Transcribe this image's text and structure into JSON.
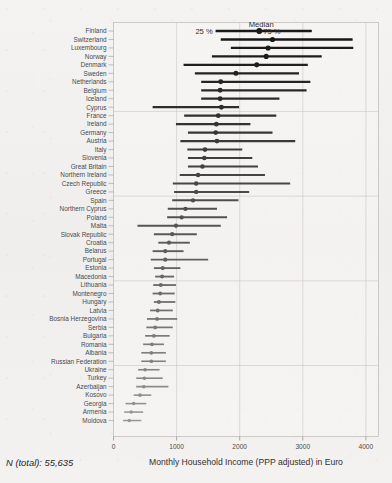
{
  "figure": {
    "n_total_label": "N (total): 55,635",
    "xlabel": "Monthly Household Income (PPP adjusted) in Euro",
    "legend": {
      "left": "25 %",
      "center": "Median",
      "right": "75 %"
    }
  },
  "chart_data": {
    "type": "scatter",
    "subtype": "dot-plot-with-interquartile-range",
    "title": "",
    "xlabel": "Monthly Household Income (PPP adjusted) in Euro",
    "ylabel": "",
    "xlim": [
      0,
      4200
    ],
    "xticks": [
      0,
      1000,
      2000,
      3000,
      4000
    ],
    "xticklabels": [
      "0",
      "1000",
      "2000",
      "3000",
      "4000"
    ],
    "grid": "vertical-and-horizontal-light",
    "legend_position": "top",
    "legend_entries": [
      "25 %",
      "Median",
      "75 %"
    ],
    "annotations": [
      "N (total): 55,635"
    ],
    "series_fields": [
      "country",
      "p25",
      "median",
      "p75"
    ],
    "categories": [
      "Finland",
      "Switzerland",
      "Luxembourg",
      "Norway",
      "Denmark",
      "Sweden",
      "Netherlands",
      "Belgium",
      "Iceland",
      "Cyprus",
      "France",
      "Ireland",
      "Germany",
      "Austria",
      "Italy",
      "Slovenia",
      "Great Britain",
      "Northern Ireland",
      "Czech Republic",
      "Greece",
      "Spain",
      "Northern Cyprus",
      "Poland",
      "Malta",
      "Slovak Republic",
      "Croatia",
      "Belarus",
      "Portugal",
      "Estonia",
      "Macedonia",
      "Lithuania",
      "Montenegro",
      "Hungary",
      "Latvia",
      "Bosnia Herzegovina",
      "Serbia",
      "Bulgaria",
      "Romania",
      "Albania",
      "Russian Federation",
      "Ukraine",
      "Turkey",
      "Azerbaijan",
      "Kosovo",
      "Georgia",
      "Armenia",
      "Moldova"
    ],
    "rows": [
      {
        "country": "Finland",
        "p25": 1620,
        "median": 2310,
        "p75": 3140
      },
      {
        "country": "Switzerland",
        "p25": 1700,
        "median": 2520,
        "p75": 3790
      },
      {
        "country": "Luxembourg",
        "p25": 1860,
        "median": 2450,
        "p75": 3800
      },
      {
        "country": "Norway",
        "p25": 1560,
        "median": 2420,
        "p75": 3300
      },
      {
        "country": "Denmark",
        "p25": 1110,
        "median": 2270,
        "p75": 3080
      },
      {
        "country": "Sweden",
        "p25": 1290,
        "median": 1940,
        "p75": 2940
      },
      {
        "country": "Netherlands",
        "p25": 1390,
        "median": 1700,
        "p75": 3120
      },
      {
        "country": "Belgium",
        "p25": 1390,
        "median": 1690,
        "p75": 3060
      },
      {
        "country": "Iceland",
        "p25": 1390,
        "median": 1690,
        "p75": 2630
      },
      {
        "country": "Cyprus",
        "p25": 620,
        "median": 1710,
        "p75": 1990
      },
      {
        "country": "France",
        "p25": 1120,
        "median": 1660,
        "p75": 2580
      },
      {
        "country": "Ireland",
        "p25": 990,
        "median": 1630,
        "p75": 2170
      },
      {
        "country": "Germany",
        "p25": 1180,
        "median": 1620,
        "p75": 2520
      },
      {
        "country": "Austria",
        "p25": 1060,
        "median": 1640,
        "p75": 2880
      },
      {
        "country": "Italy",
        "p25": 1170,
        "median": 1450,
        "p75": 2040
      },
      {
        "country": "Slovenia",
        "p25": 1180,
        "median": 1440,
        "p75": 2200
      },
      {
        "country": "Great Britain",
        "p25": 1180,
        "median": 1410,
        "p75": 2290
      },
      {
        "country": "Northern Ireland",
        "p25": 1050,
        "median": 1340,
        "p75": 2400
      },
      {
        "country": "Czech Republic",
        "p25": 940,
        "median": 1310,
        "p75": 2800
      },
      {
        "country": "Greece",
        "p25": 960,
        "median": 1310,
        "p75": 2150
      },
      {
        "country": "Spain",
        "p25": 930,
        "median": 1260,
        "p75": 1980
      },
      {
        "country": "Northern Cyprus",
        "p25": 860,
        "median": 1140,
        "p75": 1640
      },
      {
        "country": "Poland",
        "p25": 850,
        "median": 1080,
        "p75": 1800
      },
      {
        "country": "Malta",
        "p25": 380,
        "median": 990,
        "p75": 1700
      },
      {
        "country": "Slovak Republic",
        "p25": 640,
        "median": 930,
        "p75": 1320
      },
      {
        "country": "Croatia",
        "p25": 710,
        "median": 880,
        "p75": 1210
      },
      {
        "country": "Belarus",
        "p25": 620,
        "median": 820,
        "p75": 1110
      },
      {
        "country": "Portugal",
        "p25": 590,
        "median": 820,
        "p75": 1500
      },
      {
        "country": "Estonia",
        "p25": 640,
        "median": 780,
        "p75": 1060
      },
      {
        "country": "Macedonia",
        "p25": 660,
        "median": 770,
        "p75": 960
      },
      {
        "country": "Lithuania",
        "p25": 630,
        "median": 750,
        "p75": 990
      },
      {
        "country": "Montenegro",
        "p25": 620,
        "median": 740,
        "p75": 970
      },
      {
        "country": "Hungary",
        "p25": 640,
        "median": 720,
        "p75": 980
      },
      {
        "country": "Latvia",
        "p25": 580,
        "median": 700,
        "p75": 940
      },
      {
        "country": "Bosnia Herzegovina",
        "p25": 530,
        "median": 690,
        "p75": 1010
      },
      {
        "country": "Serbia",
        "p25": 520,
        "median": 660,
        "p75": 940
      },
      {
        "country": "Bulgaria",
        "p25": 500,
        "median": 640,
        "p75": 890
      },
      {
        "country": "Romania",
        "p25": 470,
        "median": 610,
        "p75": 800
      },
      {
        "country": "Albania",
        "p25": 440,
        "median": 600,
        "p75": 830
      },
      {
        "country": "Russian Federation",
        "p25": 440,
        "median": 600,
        "p75": 830
      },
      {
        "country": "Ukraine",
        "p25": 390,
        "median": 500,
        "p75": 730
      },
      {
        "country": "Turkey",
        "p25": 360,
        "median": 490,
        "p75": 780
      },
      {
        "country": "Azerbaijan",
        "p25": 360,
        "median": 480,
        "p75": 870
      },
      {
        "country": "Kosovo",
        "p25": 320,
        "median": 420,
        "p75": 600
      },
      {
        "country": "Georgia",
        "p25": 190,
        "median": 320,
        "p75": 520
      },
      {
        "country": "Armenia",
        "p25": 170,
        "median": 280,
        "p75": 470
      },
      {
        "country": "Moldova",
        "p25": 150,
        "median": 250,
        "p75": 440
      }
    ]
  },
  "style": {
    "dot_color_high": "#1b1b1b",
    "dot_color_low": "#9a9a9a",
    "bar_color_high": "#1b1b1b",
    "bar_color_low": "#9a9a9a",
    "paper_color": "#f1f0ee",
    "plot_border": "#b9b8b6"
  }
}
